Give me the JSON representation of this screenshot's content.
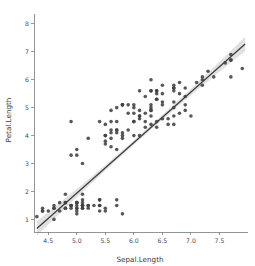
{
  "chart_data": {
    "type": "scatter",
    "title": "",
    "xlabel": "Sepal.Length",
    "ylabel": "Petal.Length",
    "xlim": [
      4.25,
      8.0
    ],
    "ylim": [
      0.55,
      8.35
    ],
    "grid": false,
    "legend": null,
    "xticks": [
      4.5,
      5.0,
      5.5,
      6.0,
      6.5,
      7.0,
      7.5
    ],
    "xticklabels": [
      "4.5",
      "5.0",
      "5.5",
      "6.0",
      "6.5",
      "7.0",
      "7.5"
    ],
    "yticks": [
      1,
      2,
      3,
      4,
      5,
      6,
      7,
      8
    ],
    "yticklabels": [
      "1",
      "2",
      "3",
      "4",
      "5",
      "6",
      "7",
      "8"
    ],
    "marker": {
      "shape": "circle",
      "color": "#414141",
      "size": 3.6,
      "opacity": 0.88
    },
    "fit": {
      "type": "linear-regression",
      "color": "#3c3c3c",
      "width": 1.25,
      "x_start": 4.3,
      "x_end": 7.95,
      "y_start": 1.0,
      "y_end": 7.6,
      "slope": 1.8086,
      "intercept": -7.101,
      "ci_band_color": "#dedede",
      "ci_half_width_center": 0.08,
      "ci_half_width_end": 0.26
    },
    "x": [
      5.1,
      4.9,
      4.7,
      4.6,
      5.0,
      5.4,
      4.6,
      5.0,
      4.4,
      4.9,
      5.4,
      4.8,
      4.8,
      4.3,
      5.8,
      5.7,
      5.4,
      5.1,
      5.7,
      5.1,
      5.4,
      5.1,
      4.6,
      5.1,
      4.8,
      5.0,
      5.0,
      5.2,
      5.2,
      4.7,
      4.8,
      5.4,
      5.2,
      5.5,
      4.9,
      5.0,
      5.5,
      4.9,
      4.4,
      5.1,
      5.0,
      4.5,
      4.4,
      5.0,
      5.1,
      4.8,
      5.1,
      4.6,
      5.3,
      5.0,
      7.0,
      6.4,
      6.9,
      5.5,
      6.5,
      5.7,
      6.3,
      4.9,
      6.6,
      5.2,
      5.0,
      5.9,
      6.0,
      6.1,
      5.6,
      6.7,
      5.6,
      5.8,
      6.2,
      5.6,
      5.9,
      6.1,
      6.3,
      6.1,
      6.4,
      6.6,
      6.8,
      6.7,
      6.0,
      5.7,
      5.5,
      5.5,
      5.8,
      6.0,
      5.4,
      6.0,
      6.7,
      6.3,
      5.6,
      5.5,
      5.5,
      6.1,
      5.8,
      5.0,
      5.6,
      5.7,
      5.7,
      6.2,
      5.1,
      5.7,
      6.3,
      5.8,
      7.1,
      6.3,
      6.5,
      7.6,
      4.9,
      7.3,
      6.7,
      7.2,
      6.5,
      6.4,
      6.8,
      5.7,
      5.8,
      6.4,
      6.5,
      7.7,
      7.7,
      6.0,
      6.9,
      5.6,
      7.7,
      6.3,
      6.7,
      7.2,
      6.2,
      6.1,
      6.4,
      7.2,
      7.4,
      7.9,
      6.4,
      6.3,
      6.1,
      7.7,
      6.3,
      6.4,
      6.0,
      6.9,
      6.7,
      6.9,
      5.8,
      6.8,
      6.7,
      6.7,
      6.3,
      6.5,
      6.2,
      5.9
    ],
    "y": [
      1.4,
      1.4,
      1.3,
      1.5,
      1.4,
      1.7,
      1.4,
      1.5,
      1.4,
      1.5,
      1.5,
      1.6,
      1.4,
      1.1,
      1.2,
      1.5,
      1.3,
      1.4,
      1.7,
      1.5,
      1.7,
      1.5,
      1.0,
      1.7,
      1.9,
      1.6,
      1.6,
      1.5,
      1.4,
      1.6,
      1.6,
      1.5,
      1.5,
      1.4,
      1.5,
      1.2,
      1.3,
      1.5,
      1.3,
      1.5,
      1.3,
      1.3,
      1.3,
      1.6,
      1.9,
      1.4,
      1.6,
      1.4,
      1.5,
      1.4,
      4.7,
      4.5,
      4.9,
      4.0,
      4.6,
      4.5,
      4.7,
      3.3,
      4.6,
      3.9,
      3.5,
      4.2,
      4.0,
      4.7,
      3.6,
      4.4,
      4.5,
      4.1,
      4.5,
      3.9,
      4.8,
      4.0,
      4.9,
      4.7,
      4.3,
      4.4,
      4.8,
      5.0,
      4.5,
      3.5,
      3.8,
      3.7,
      3.9,
      5.1,
      4.5,
      4.5,
      4.7,
      4.4,
      4.1,
      4.0,
      4.4,
      4.6,
      4.0,
      3.3,
      4.2,
      4.2,
      4.2,
      4.3,
      3.0,
      4.1,
      6.0,
      5.1,
      5.9,
      5.6,
      5.8,
      6.6,
      4.5,
      6.3,
      5.8,
      6.1,
      5.1,
      5.3,
      5.5,
      5.0,
      5.1,
      5.3,
      5.5,
      6.7,
      6.9,
      5.0,
      5.7,
      4.9,
      6.7,
      4.9,
      5.7,
      6.0,
      4.8,
      4.9,
      5.6,
      5.8,
      6.1,
      6.4,
      5.6,
      5.1,
      5.6,
      6.1,
      5.6,
      5.5,
      4.8,
      5.4,
      5.6,
      5.1,
      5.1,
      5.9,
      5.7,
      5.2,
      5.0,
      5.2,
      5.4,
      5.1
    ]
  },
  "axes": {
    "x_title": "Sepal.Length",
    "y_title": "Petal.Length"
  }
}
